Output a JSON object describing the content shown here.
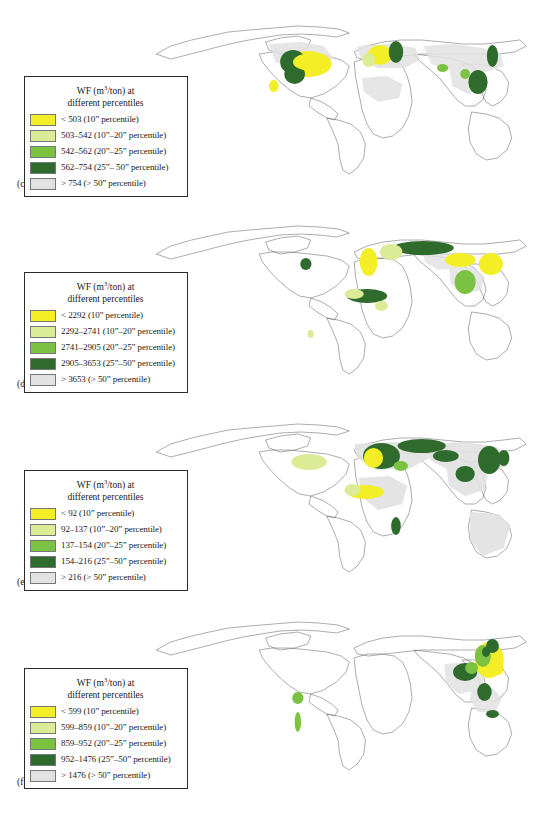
{
  "figure": {
    "legend_title_line1": "WF (m3/ton) at",
    "legend_title_line2": "different percentiles",
    "legend_unit_numerator": "m",
    "legend_unit_sup": "3",
    "legend_unit_denominator": "/ton"
  },
  "colors": {
    "class1_yellow": "#f4ee26",
    "class2_light_green": "#dbeb96",
    "class3_green": "#7cc242",
    "class4_dark_green": "#2e6b2d",
    "class5_grey": "#e2e2e2",
    "map_outline": "#5a5a5a",
    "border": "#2b2b2b",
    "background": "#ffffff"
  },
  "panels": [
    {
      "id": "maize",
      "caption": "(c) Maize",
      "legend": {
        "title_line1": "WF (m",
        "title_sup": "3",
        "title_line1b": "/ton) at",
        "title_line2": "different percentiles",
        "rows": [
          {
            "color": "#f4ee26",
            "label": "< 503 (10ˮ percentile)"
          },
          {
            "color": "#dbeb96",
            "label": "503–542 (10ˮ–20ˮ percentile)"
          },
          {
            "color": "#7cc242",
            "label": "542–562 (20ˮ–25ˮ percentile)"
          },
          {
            "color": "#2e6b2d",
            "label": "562–754 (25ˮ– 50ˮ percentile)"
          },
          {
            "color": "#e2e2e2",
            "label": "> 754 (> 50ˮ percentile)"
          }
        ]
      },
      "map_data": {
        "hotspots": [
          {
            "region": "US Corn Belt",
            "x": 228,
            "y": 62,
            "w": 58,
            "h": 26,
            "class": 1
          },
          {
            "region": "US Midwest fringe",
            "x": 218,
            "y": 55,
            "w": 26,
            "h": 20,
            "class": 4
          },
          {
            "region": "Central Europe",
            "x": 329,
            "y": 48,
            "w": 28,
            "h": 18,
            "class": 1
          },
          {
            "region": "Eastern Europe",
            "x": 352,
            "y": 44,
            "w": 18,
            "h": 20,
            "class": 4
          },
          {
            "region": "South China",
            "x": 450,
            "y": 72,
            "w": 24,
            "h": 22,
            "class": 4
          },
          {
            "region": "NE China",
            "x": 472,
            "y": 48,
            "w": 14,
            "h": 20,
            "class": 4
          },
          {
            "region": "Mexico",
            "x": 204,
            "y": 82,
            "w": 12,
            "h": 12,
            "class": 1
          }
        ]
      }
    },
    {
      "id": "millet",
      "caption": "(d) Millet",
      "legend": {
        "title_line1": "WF (m",
        "title_sup": "3",
        "title_line1b": "/ton) at",
        "title_line2": "different percentiles",
        "rows": [
          {
            "color": "#f4ee26",
            "label": "< 2292 (10ˮ percentile)"
          },
          {
            "color": "#dbeb96",
            "label": "2292–2741 (10ˮ–20ˮ percentile)"
          },
          {
            "color": "#7cc242",
            "label": "2741–2905 (20ˮ–25ˮ percentile)"
          },
          {
            "color": "#2e6b2d",
            "label": "2905–3653 (25ˮ–50ˮ percentile)"
          },
          {
            "color": "#e2e2e2",
            "label": "> 3653 (> 50ˮ percentile)"
          }
        ]
      },
      "map_data": {
        "hotspots": [
          {
            "region": "Western Europe",
            "x": 314,
            "y": 48,
            "w": 22,
            "h": 26,
            "class": 1
          },
          {
            "region": "Russia steppe",
            "x": 355,
            "y": 40,
            "w": 75,
            "h": 14,
            "class": 4
          },
          {
            "region": "Central Asia",
            "x": 420,
            "y": 52,
            "w": 38,
            "h": 14,
            "class": 1
          },
          {
            "region": "North China",
            "x": 462,
            "y": 52,
            "w": 30,
            "h": 22,
            "class": 1
          },
          {
            "region": "India",
            "x": 432,
            "y": 70,
            "w": 26,
            "h": 24,
            "class": 3
          },
          {
            "region": "Sahel",
            "x": 300,
            "y": 88,
            "w": 50,
            "h": 14,
            "class": 4
          },
          {
            "region": "USA Great Plains",
            "x": 240,
            "y": 58,
            "w": 14,
            "h": 12,
            "class": 4
          }
        ]
      }
    },
    {
      "id": "potatoes",
      "caption": "(e) Potatoes",
      "legend": {
        "title_line1": "WF (m",
        "title_sup": "3",
        "title_line1b": "/ton) at",
        "title_line2": "different percentiles",
        "rows": [
          {
            "color": "#f4ee26",
            "label": "< 92 (10ˮ percentile)"
          },
          {
            "color": "#dbeb96",
            "label": "92–137 (10ˮ–20ˮ percentile)"
          },
          {
            "color": "#7cc242",
            "label": "137–154 (20ˮ–25ˮ percentile)"
          },
          {
            "color": "#2e6b2d",
            "label": "154–216 (25ˮ–50ˮ percentile)"
          },
          {
            "color": "#e2e2e2",
            "label": "> 216 (> 50ˮ percentile)"
          }
        ]
      },
      "map_data": {
        "hotspots": [
          {
            "region": "Europe core",
            "x": 318,
            "y": 46,
            "w": 46,
            "h": 26,
            "class": 4
          },
          {
            "region": "Russia",
            "x": 360,
            "y": 40,
            "w": 60,
            "h": 16,
            "class": 4
          },
          {
            "region": "North China",
            "x": 462,
            "y": 48,
            "w": 28,
            "h": 24,
            "class": 4
          },
          {
            "region": "India",
            "x": 432,
            "y": 66,
            "w": 24,
            "h": 16,
            "class": 4
          },
          {
            "region": "USA",
            "x": 230,
            "y": 54,
            "w": 42,
            "h": 16,
            "class": 2
          },
          {
            "region": "West Africa",
            "x": 298,
            "y": 86,
            "w": 46,
            "h": 14,
            "class": 1
          },
          {
            "region": "East Africa",
            "x": 352,
            "y": 118,
            "w": 12,
            "h": 16,
            "class": 4
          }
        ]
      }
    },
    {
      "id": "rice",
      "caption": "(f) Rice",
      "legend": {
        "title_line1": "WF (m",
        "title_sup": "3",
        "title_line1b": "/ton) at",
        "title_line2": "different percentiles",
        "rows": [
          {
            "color": "#f4ee26",
            "label": "< 599 (10ˮ percentile)"
          },
          {
            "color": "#dbeb96",
            "label": "599–859 (10ˮ–20ˮ percentile)"
          },
          {
            "color": "#7cc242",
            "label": "859–952 (20ˮ–25ˮ percentile)"
          },
          {
            "color": "#2e6b2d",
            "label": "952–1476 (25ˮ–50ˮ percentile)"
          },
          {
            "color": "#e2e2e2",
            "label": "> 1476 (> 50ˮ percentile)"
          }
        ]
      },
      "map_data": {
        "hotspots": [
          {
            "region": "East China",
            "x": 458,
            "y": 50,
            "w": 34,
            "h": 32,
            "class": 1
          },
          {
            "region": "NE China",
            "x": 472,
            "y": 42,
            "w": 16,
            "h": 14,
            "class": 4
          },
          {
            "region": "India / Bangladesh",
            "x": 428,
            "y": 64,
            "w": 34,
            "h": 18,
            "class": 4
          },
          {
            "region": "SE Asia",
            "x": 462,
            "y": 86,
            "w": 20,
            "h": 18,
            "class": 4
          },
          {
            "region": "Indonesia / Java",
            "x": 470,
            "y": 110,
            "w": 18,
            "h": 8,
            "class": 4
          },
          {
            "region": "Andes / Colombia",
            "x": 230,
            "y": 96,
            "w": 14,
            "h": 12,
            "class": 3
          },
          {
            "region": "Peru coast",
            "x": 232,
            "y": 118,
            "w": 10,
            "h": 18,
            "class": 3
          }
        ]
      }
    }
  ]
}
